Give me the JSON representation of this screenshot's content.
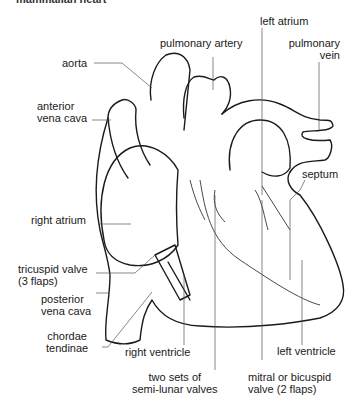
{
  "figure": {
    "cut_title": "mammalian heart",
    "labels": {
      "aorta": "aorta",
      "pulmonary_artery": "pulmonary artery",
      "left_atrium": "left atrium",
      "pulmonary_vein_1": "pulmonary",
      "pulmonary_vein_2": "vein",
      "anterior_vena_cava_1": "anterior",
      "anterior_vena_cava_2": "vena cava",
      "septum": "septum",
      "right_atrium": "right atrium",
      "tricuspid_1": "tricuspid valve",
      "tricuspid_2": "(3 flaps)",
      "posterior_vena_cava_1": "posterior",
      "posterior_vena_cava_2": "vena cava",
      "chordae_1": "chordae",
      "chordae_2": "tendinae",
      "right_ventricle": "right ventricle",
      "left_ventricle": "left ventricle",
      "semilunar_1": "two sets of",
      "semilunar_2": "semi-lunar valves",
      "mitral_1": "mitral or bicuspid",
      "mitral_2": "valve (2 flaps)"
    },
    "colors": {
      "line": "#1a1a1a",
      "leader": "#555555",
      "background": "#ffffff"
    }
  }
}
